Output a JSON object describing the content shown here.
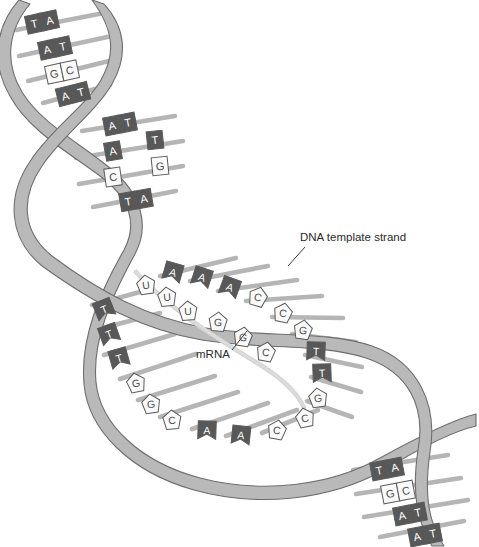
{
  "figure": {
    "background": "#ffffff"
  },
  "colors": {
    "ribbon_fill": "#b9b9b9",
    "ribbon_stroke": "#6e6e6e",
    "rung": "#b5b5b5",
    "base_dark_fill": "#585858",
    "base_dark_text": "#ffffff",
    "base_light_fill": "#fbfbfb",
    "base_light_text": "#4a4a4a",
    "base_stroke": "#5a5a5a",
    "mrna_backbone": "#d2d2d2",
    "label_text": "#2b2b2b",
    "leader_line": "#3a3a3a",
    "bubble_fill": "#ffffff"
  },
  "labels": [
    {
      "id": "dna-template-strand",
      "text": "DNA  template strand",
      "x": 300,
      "y": 241,
      "leader": {
        "x1": 305,
        "y1": 247,
        "x2": 288,
        "y2": 266
      }
    },
    {
      "id": "mrna",
      "text": "mRNA",
      "x": 196,
      "y": 356,
      "leader": {
        "x1": 232,
        "y1": 350,
        "x2": 247,
        "y2": 331
      }
    }
  ],
  "segments": {
    "top_helix": {
      "name": "upper double helix",
      "pairs": [
        {
          "left": "T",
          "right": "A",
          "left_shade": "dark",
          "right_shade": "dark",
          "paired": true
        },
        {
          "left": "A",
          "right": "T",
          "left_shade": "dark",
          "right_shade": "dark",
          "paired": true
        },
        {
          "left": "G",
          "right": "C",
          "left_shade": "light",
          "right_shade": "light",
          "paired": true
        },
        {
          "left": "A",
          "right": "T",
          "left_shade": "dark",
          "right_shade": "dark",
          "paired": true
        }
      ]
    },
    "upper_middle_helix": {
      "name": "second turn of the helix",
      "pairs": [
        {
          "left": "A",
          "right": "T",
          "left_shade": "dark",
          "right_shade": "dark",
          "paired": true
        },
        {
          "left": "A",
          "right": "T",
          "left_shade": "dark",
          "right_shade": "dark",
          "paired": false
        },
        {
          "left": "C",
          "right": "G",
          "left_shade": "light",
          "right_shade": "light",
          "paired": false
        },
        {
          "left": "T",
          "right": "A",
          "left_shade": "dark",
          "right_shade": "dark",
          "paired": true
        }
      ]
    },
    "bubble": {
      "name": "transcription bubble (open region)",
      "template_strand_bases": [
        "T",
        "T",
        "T",
        "G",
        "G",
        "C",
        "A",
        "A",
        "C"
      ],
      "coding_strand_bases": [
        "A",
        "A",
        "A",
        "C",
        "C",
        "G",
        "T",
        "T",
        "G"
      ],
      "mrna_bases": [
        "A",
        "A",
        "A",
        "U",
        "U",
        "U",
        "G",
        "G",
        "C"
      ]
    },
    "bottom_right_helix": {
      "name": "lower double helix",
      "pairs": [
        {
          "left": "T",
          "right": "A",
          "left_shade": "dark",
          "right_shade": "dark",
          "paired": true
        },
        {
          "left": "G",
          "right": "C",
          "left_shade": "light",
          "right_shade": "light",
          "paired": true
        },
        {
          "left": "A",
          "right": "T",
          "left_shade": "dark",
          "right_shade": "dark",
          "paired": true
        },
        {
          "left": "A",
          "right": "T",
          "left_shade": "dark",
          "right_shade": "dark",
          "paired": true
        }
      ]
    }
  },
  "base_glyphs": {
    "A": "A",
    "T": "T",
    "G": "G",
    "C": "C",
    "U": "U"
  },
  "bubble_bases_left": [
    {
      "letter": "T",
      "shade": "dark",
      "x": 104,
      "y": 309,
      "rot": -22
    },
    {
      "letter": "T",
      "shade": "dark",
      "x": 109,
      "y": 334,
      "rot": -20
    },
    {
      "letter": "T",
      "shade": "dark",
      "x": 119,
      "y": 358,
      "rot": -16
    },
    {
      "letter": "G",
      "shade": "light",
      "x": 136,
      "y": 383,
      "rot": -12
    },
    {
      "letter": "G",
      "shade": "light",
      "x": 151,
      "y": 404,
      "rot": -8
    },
    {
      "letter": "C",
      "shade": "light",
      "x": 172,
      "y": 420,
      "rot": -4
    },
    {
      "letter": "A",
      "shade": "dark",
      "x": 207,
      "y": 430,
      "rot": 2
    },
    {
      "letter": "A",
      "shade": "dark",
      "x": 241,
      "y": 435,
      "rot": 6
    },
    {
      "letter": "C",
      "shade": "light",
      "x": 277,
      "y": 430,
      "rot": 10
    }
  ],
  "bubble_bases_right": [
    {
      "letter": "A",
      "shade": "dark",
      "x": 173,
      "y": 272,
      "rot": 16
    },
    {
      "letter": "A",
      "shade": "dark",
      "x": 202,
      "y": 277,
      "rot": 18
    },
    {
      "letter": "A",
      "shade": "dark",
      "x": 230,
      "y": 287,
      "rot": 20
    },
    {
      "letter": "C",
      "shade": "light",
      "x": 258,
      "y": 297,
      "rot": 16
    },
    {
      "letter": "C",
      "shade": "light",
      "x": 283,
      "y": 313,
      "rot": 12
    },
    {
      "letter": "G",
      "shade": "light",
      "x": 303,
      "y": 330,
      "rot": 8
    },
    {
      "letter": "T",
      "shade": "dark",
      "x": 316,
      "y": 351,
      "rot": 2
    },
    {
      "letter": "T",
      "shade": "dark",
      "x": 322,
      "y": 373,
      "rot": -2
    },
    {
      "letter": "G",
      "shade": "light",
      "x": 318,
      "y": 398,
      "rot": -8
    },
    {
      "letter": "C",
      "shade": "light",
      "x": 305,
      "y": 418,
      "rot": -12
    }
  ],
  "mrna_bases": [
    {
      "letter": "U",
      "x": 146,
      "y": 285,
      "rot": -8
    },
    {
      "letter": "U",
      "x": 167,
      "y": 297,
      "rot": -6
    },
    {
      "letter": "U",
      "x": 188,
      "y": 311,
      "rot": -4
    },
    {
      "letter": "G",
      "x": 218,
      "y": 322,
      "rot": 4
    },
    {
      "letter": "G",
      "x": 243,
      "y": 337,
      "rot": 8
    },
    {
      "letter": "C",
      "x": 266,
      "y": 352,
      "rot": 10
    }
  ]
}
